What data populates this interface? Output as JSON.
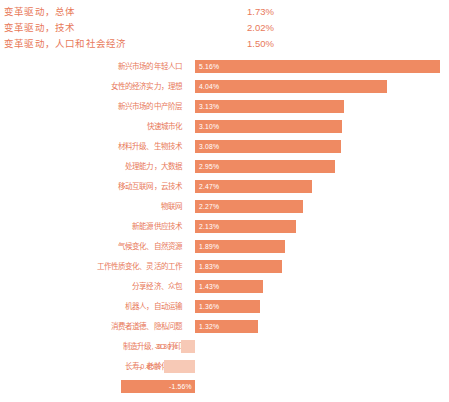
{
  "summary": {
    "rows": [
      {
        "label": "变革驱动，总体",
        "value": "1.73%"
      },
      {
        "label": "变革驱动，技术",
        "value": "2.02%"
      },
      {
        "label": "变革驱动，人口和社会经济",
        "value": "1.50%"
      }
    ]
  },
  "colors": {
    "bar": "#ef8a62",
    "bar_negative": "#f7c9b6",
    "text": "#e8795a",
    "value_text": "#ffffff",
    "background": "#ffffff"
  },
  "chart_data": {
    "type": "bar",
    "orientation": "horizontal",
    "title": "",
    "xlabel": "",
    "ylabel": "",
    "grid": false,
    "legend": false,
    "xlim": [
      -2.0,
      5.5
    ],
    "zero_baseline": true,
    "categories": [
      "新兴市场的年轻人口",
      "女性的经济实力，理想",
      "新兴市场的中产阶层",
      "快速城市化",
      "材料升级、生物技术",
      "处理能力，大数据",
      "移动互联网，云技术",
      "物联网",
      "新能源供应技术",
      "气候变化、自然资源",
      "工作性质变化、灵活的工作",
      "分享经济、众包",
      "机器人，自动运输",
      "消费者道德、隐私问题",
      "制造升级, 3D 打印",
      "长寿，老龄化社会",
      "人工智能"
    ],
    "values": [
      5.16,
      4.04,
      3.13,
      3.1,
      3.08,
      2.95,
      2.47,
      2.27,
      2.13,
      1.89,
      1.83,
      1.43,
      1.36,
      1.32,
      -0.3,
      -0.65,
      -1.56
    ],
    "value_labels": [
      "5.16%",
      "4.04%",
      "3.13%",
      "3.10%",
      "3.08%",
      "2.95%",
      "2.47%",
      "2.27%",
      "2.13%",
      "1.89%",
      "1.83%",
      "1.43%",
      "1.36%",
      "1.32%",
      "-0.30%",
      "-0.65%",
      "-1.56%"
    ]
  }
}
